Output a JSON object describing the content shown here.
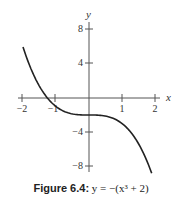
{
  "chart_data": {
    "type": "line",
    "title": "",
    "xlabel": "x",
    "ylabel": "y",
    "xlim": [
      -2,
      2
    ],
    "ylim": [
      -8,
      8
    ],
    "grid": false,
    "x_ticks": [
      -2,
      -1,
      1,
      2
    ],
    "x_tick_labels": [
      "−2",
      "−1",
      "1",
      "2"
    ],
    "y_ticks": [
      8,
      4,
      -4,
      -8
    ],
    "y_tick_labels": [
      "8",
      "4",
      "−4",
      "−8"
    ],
    "series": [
      {
        "name": "y = −(x³ + 2)",
        "function": "-(x^3 + 2)",
        "x": [
          -2,
          -1.75,
          -1.5,
          -1.26,
          -1,
          -0.5,
          0,
          0.5,
          1,
          1.25,
          1.5,
          1.75,
          1.9
        ],
        "y": [
          6,
          3.36,
          1.38,
          0,
          -1,
          -1.88,
          -2,
          -2.13,
          -3,
          -3.95,
          -5.38,
          -7.36,
          -8.86
        ]
      }
    ],
    "caption": "Figure 6.4: y = −(x³ + 2)"
  },
  "caption": {
    "figure_label": "Figure 6.4",
    "separator": ":",
    "equation": "y = −(x³ + 2)"
  },
  "axes": {
    "x_label": "x",
    "y_label": "y"
  }
}
